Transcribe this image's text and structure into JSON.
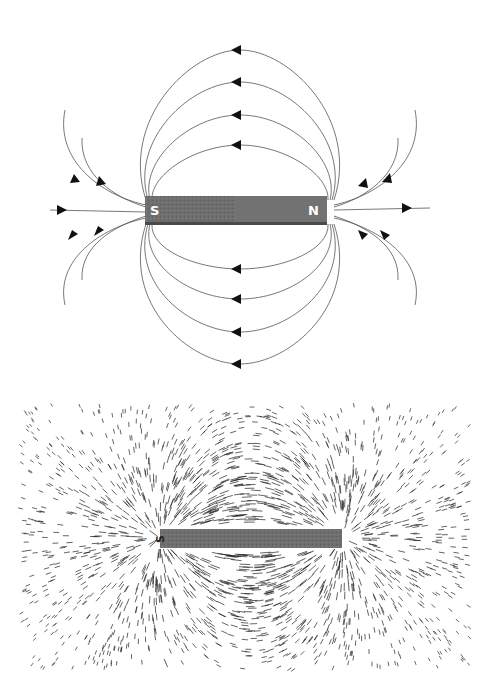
{
  "top_figure": {
    "name": "bar-magnet-field-line-diagram",
    "magnet": {
      "south_label": "S",
      "north_label": "N",
      "color": "#6a6a6a"
    },
    "line_color": "#555555"
  },
  "bottom_figure": {
    "name": "iron-filings-photo",
    "magnet": {
      "south_label": "S"
    }
  }
}
